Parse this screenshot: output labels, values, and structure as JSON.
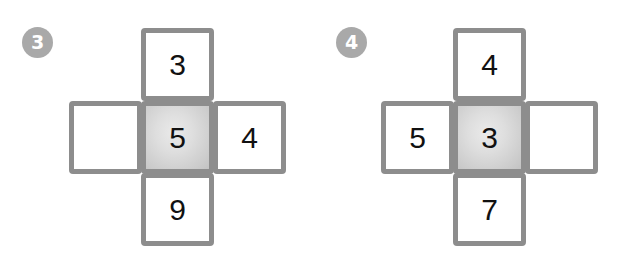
{
  "page": {
    "background_color": "#ffffff",
    "width": 629,
    "height": 267
  },
  "style": {
    "border_color": "#8d8d8d",
    "badge_color": "#a9a9a9",
    "badge_text_color": "#ffffff",
    "digit_color": "#111111",
    "center_fill_light": "#eaeaea",
    "center_fill_dark": "#c2c2c2"
  },
  "puzzles": [
    {
      "badge_label": "3",
      "cells": {
        "top": {
          "value": "3",
          "empty": false,
          "highlighted": false
        },
        "left": {
          "value": "",
          "empty": true,
          "highlighted": false
        },
        "center": {
          "value": "5",
          "empty": false,
          "highlighted": true
        },
        "right": {
          "value": "4",
          "empty": false,
          "highlighted": false
        },
        "bottom": {
          "value": "9",
          "empty": false,
          "highlighted": false
        }
      }
    },
    {
      "badge_label": "4",
      "cells": {
        "top": {
          "value": "4",
          "empty": false,
          "highlighted": false
        },
        "left": {
          "value": "5",
          "empty": false,
          "highlighted": false
        },
        "center": {
          "value": "3",
          "empty": false,
          "highlighted": true
        },
        "right": {
          "value": "",
          "empty": true,
          "highlighted": false
        },
        "bottom": {
          "value": "7",
          "empty": false,
          "highlighted": false
        }
      }
    }
  ]
}
